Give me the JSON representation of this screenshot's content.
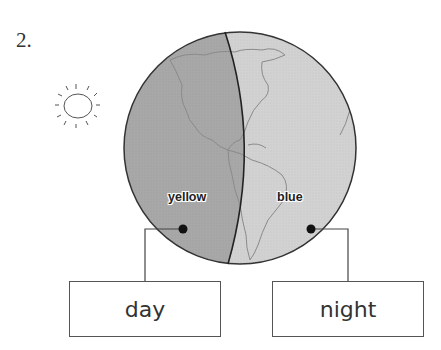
{
  "question_number": "2.",
  "icons": {
    "sun": "sun-icon",
    "globe": "earth-globe-icon"
  },
  "globe": {
    "day_side_label": "yellow",
    "night_side_label": "blue",
    "day_side_color": "#a8a8a8",
    "night_side_color": "#d2d2d2"
  },
  "answers": {
    "left_box": "day",
    "right_box": "night"
  }
}
